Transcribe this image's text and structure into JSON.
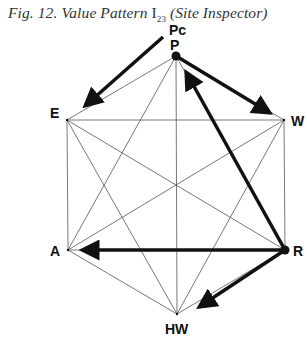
{
  "caption": {
    "prefix": "Fig. 12.  Value Pattern ",
    "symbol": "I",
    "subscript": "23",
    "suffix": " (Site Inspector)"
  },
  "diagram": {
    "type": "complete-graph-hexagon",
    "nodes": [
      {
        "id": "P",
        "label": "P",
        "x": 176,
        "y": 56,
        "emphasized": true
      },
      {
        "id": "W",
        "label": "W",
        "x": 284,
        "y": 120,
        "emphasized": false
      },
      {
        "id": "R",
        "label": "R",
        "x": 285,
        "y": 250,
        "emphasized": true
      },
      {
        "id": "HW",
        "label": "HW",
        "x": 177,
        "y": 314,
        "emphasized": false
      },
      {
        "id": "A",
        "label": "A",
        "x": 68,
        "y": 250,
        "emphasized": false
      },
      {
        "id": "E",
        "label": "E",
        "x": 67,
        "y": 120,
        "emphasized": false
      }
    ],
    "extra_labels": [
      {
        "id": "Pc",
        "label": "Pc"
      }
    ],
    "arrows": [
      {
        "from": "Pc",
        "to": "E"
      },
      {
        "from": "P",
        "to": "W"
      },
      {
        "from": "R",
        "to": "P"
      },
      {
        "from": "R",
        "to": "A"
      },
      {
        "from": "R",
        "to": "HW"
      }
    ]
  }
}
